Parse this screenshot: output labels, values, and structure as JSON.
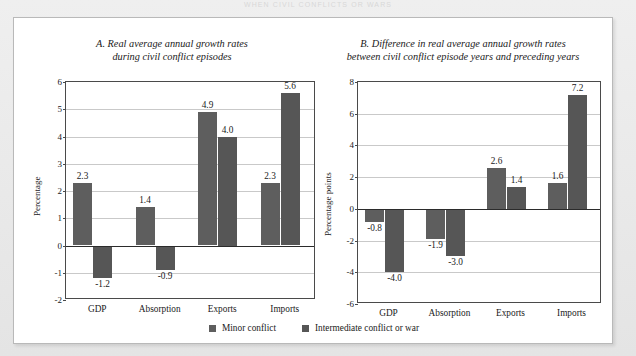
{
  "page": {
    "running_header": "WHEN CIVIL CONFLICTS OR WARS"
  },
  "legend": {
    "position": "bottom-center",
    "items": [
      {
        "label": "Minor conflict",
        "color": "#5e5e5e"
      },
      {
        "label": "Intermediate conflict or war",
        "color": "#565656"
      }
    ]
  },
  "chart_data": [
    {
      "id": "chart-a",
      "type": "bar",
      "title": "A. Real average annual growth rates\nduring civil conflict episodes",
      "title_line1": "A. Real average annual growth rates",
      "title_line2": "during civil conflict episodes",
      "xlabel": "",
      "ylabel": "Percentage",
      "ylim": [
        -2,
        6
      ],
      "ytick_values": [
        6,
        5,
        4,
        3,
        2,
        1,
        0,
        -1,
        -2
      ],
      "ytick_labels": [
        "6",
        "5",
        "4",
        "3",
        "2",
        "1",
        "0",
        "-1",
        "-2"
      ],
      "grid": true,
      "categories": [
        "GDP",
        "Absorption",
        "Exports",
        "Imports"
      ],
      "series": [
        {
          "name": "Minor conflict",
          "values": [
            2.3,
            1.4,
            4.9,
            2.3
          ],
          "labels": [
            "2.3",
            "1.4",
            "4.9",
            "2.3"
          ]
        },
        {
          "name": "Intermediate conflict or war",
          "values": [
            -1.2,
            -0.9,
            4.0,
            5.6
          ],
          "labels": [
            "-1.2",
            "-0.9",
            "4.0",
            "5.6"
          ]
        }
      ]
    },
    {
      "id": "chart-b",
      "type": "bar",
      "title": "B. Difference in real average annual growth rates\nbetween civil conflict episode years and preceding years",
      "title_line1": "B. Difference in real average annual growth rates",
      "title_line2": "between civil conflict episode years and preceding years",
      "xlabel": "",
      "ylabel": "Percentage points",
      "ylim": [
        -6,
        8
      ],
      "ytick_values": [
        8,
        6,
        4,
        2,
        0,
        -2,
        -4,
        -6
      ],
      "ytick_labels": [
        "8",
        "6",
        "4",
        "2",
        "0",
        "-2",
        "-4",
        "-6"
      ],
      "grid": true,
      "categories": [
        "GDP",
        "Absorption",
        "Exports",
        "Imports"
      ],
      "series": [
        {
          "name": "Minor conflict",
          "values": [
            -0.8,
            -1.9,
            2.6,
            1.6
          ],
          "labels": [
            "-0.8",
            "-1.9",
            "2.6",
            "1.6"
          ]
        },
        {
          "name": "Intermediate conflict or war",
          "values": [
            -4.0,
            -3.0,
            1.4,
            7.2
          ],
          "labels": [
            "-4.0",
            "-3.0",
            "1.4",
            "7.2"
          ]
        }
      ]
    }
  ]
}
